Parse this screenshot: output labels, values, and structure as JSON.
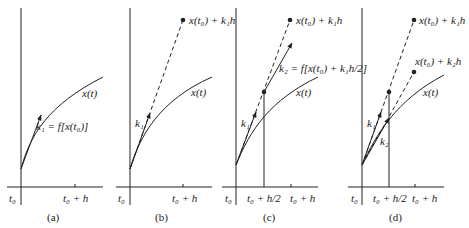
{
  "panels": [
    {
      "id": "a",
      "caption": "(a)",
      "curve_label": "x(t)",
      "slope_label": "k₁ = f[x(t₀)]",
      "tick_start": "t₀",
      "tick_end": "t₀ + h"
    },
    {
      "id": "b",
      "caption": "(b)",
      "curve_label": "x(t)",
      "slope_label": "k₁",
      "point_label": "x(t₀) + k₁h",
      "tick_start": "t₀",
      "tick_end": "t₀ + h"
    },
    {
      "id": "c",
      "caption": "(c)",
      "curve_label": "x(t)",
      "slope1_label": "k₁",
      "slope2_label": "k₂ = f[x(t₀) + k₁h/2]",
      "point_label": "x(t₀) + k₁h",
      "tick_start": "t₀",
      "tick_mid": "t₀ + h/2",
      "tick_end": "t₀ + h"
    },
    {
      "id": "d",
      "caption": "(d)",
      "curve_label": "x(t)",
      "slope1_label": "k₁",
      "slope2_label": "k₂",
      "point1_label": "x(t₀) + k₁h",
      "point2_label": "x(t₀) + k₂h",
      "tick_start": "t₀",
      "tick_mid": "t₀ + h/2",
      "tick_end": "t₀ + h"
    }
  ]
}
